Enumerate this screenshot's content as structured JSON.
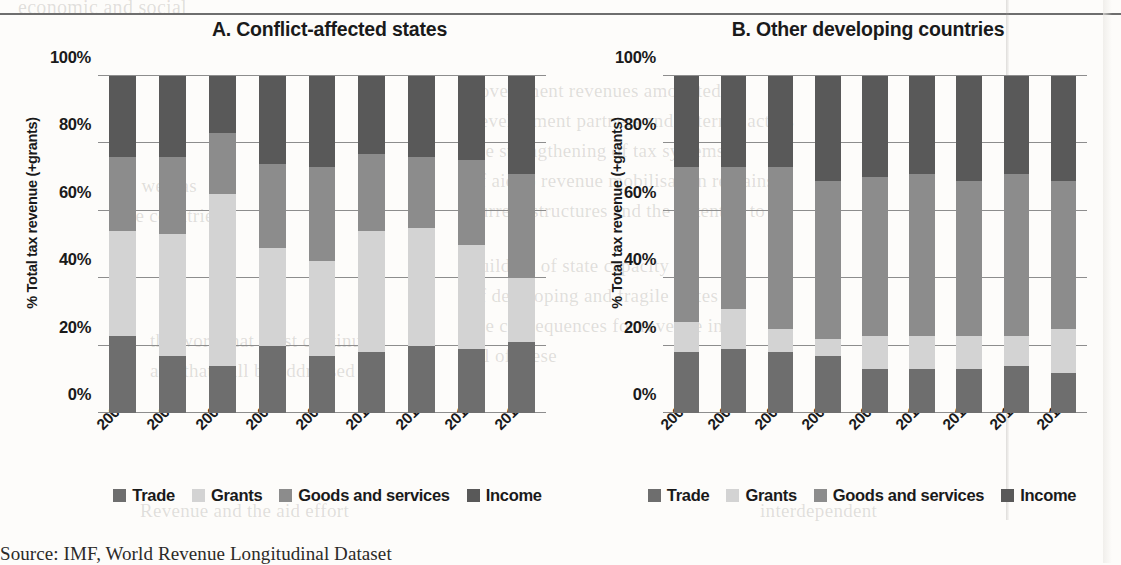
{
  "page": {
    "source_note": "Source: IMF, World Revenue Longitudinal Dataset"
  },
  "bleed_text": [
    {
      "t": "economic and social",
      "x": 18,
      "y": -4,
      "s": 20
    },
    {
      "t": "government revenues amounted to",
      "x": 470,
      "y": 80,
      "s": 19
    },
    {
      "t": "development partners and external actors",
      "x": 470,
      "y": 110,
      "s": 19
    },
    {
      "t": "the strengthening of tax systems is",
      "x": 470,
      "y": 140,
      "s": 19
    },
    {
      "t": "of aid to revenue mobilisation remains",
      "x": 470,
      "y": 170,
      "s": 19
    },
    {
      "t": "current structures and the potential to",
      "x": 470,
      "y": 200,
      "s": 19
    },
    {
      "t": "building of state capacity",
      "x": 470,
      "y": 255,
      "s": 19
    },
    {
      "t": "of developing and fragile states",
      "x": 470,
      "y": 285,
      "s": 19
    },
    {
      "t": "the consequences for revenue in",
      "x": 470,
      "y": 315,
      "s": 19
    },
    {
      "t": "all of these",
      "x": 470,
      "y": 345,
      "s": 19
    },
    {
      "t": "as well as",
      "x": 120,
      "y": 175,
      "s": 19
    },
    {
      "t": "the countries",
      "x": 120,
      "y": 205,
      "s": 19
    },
    {
      "t": "the work that must continue",
      "x": 150,
      "y": 330,
      "s": 19
    },
    {
      "t": "and that will be addressed",
      "x": 150,
      "y": 360,
      "s": 19
    },
    {
      "t": "Revenue and the aid effort",
      "x": 140,
      "y": 500,
      "s": 19
    },
    {
      "t": "interdependent",
      "x": 760,
      "y": 500,
      "s": 19
    }
  ],
  "chart_data": [
    {
      "id": "A",
      "type": "bar",
      "stacked": true,
      "normalized_percent": true,
      "title": "A. Conflict-affected states",
      "xlabel": "",
      "ylabel": "% Total tax revenue (+grants)",
      "ylim": [
        0,
        100
      ],
      "yticks": [
        "0%",
        "20%",
        "40%",
        "60%",
        "80%",
        "100%"
      ],
      "ytick_values": [
        0,
        20,
        40,
        60,
        80,
        100
      ],
      "grid": true,
      "legend_position": "bottom",
      "categories": [
        "2005",
        "2006",
        "2007",
        "2008",
        "2009",
        "2010",
        "2011",
        "2012",
        "2013"
      ],
      "series": [
        {
          "name": "Trade",
          "color": "#6e6e6e",
          "values": [
            23,
            17,
            14,
            20,
            17,
            18,
            20,
            19,
            21
          ]
        },
        {
          "name": "Grants",
          "color": "#d3d3d3",
          "values": [
            31,
            36,
            51,
            29,
            28,
            36,
            35,
            31,
            19
          ]
        },
        {
          "name": "Goods and services",
          "color": "#8c8c8c",
          "values": [
            22,
            23,
            18,
            25,
            28,
            23,
            21,
            25,
            31
          ]
        },
        {
          "name": "Income",
          "color": "#595959",
          "values": [
            24,
            24,
            17,
            26,
            27,
            23,
            24,
            25,
            29
          ]
        }
      ]
    },
    {
      "id": "B",
      "type": "bar",
      "stacked": true,
      "normalized_percent": true,
      "title": "B. Other developing countries",
      "xlabel": "",
      "ylabel": "% Total tax revenue (+grants)",
      "ylim": [
        0,
        100
      ],
      "yticks": [
        "0%",
        "20%",
        "40%",
        "60%",
        "80%",
        "100%"
      ],
      "ytick_values": [
        0,
        20,
        40,
        60,
        80,
        100
      ],
      "grid": true,
      "legend_position": "bottom",
      "categories": [
        "2005",
        "2006",
        "2007",
        "2008",
        "2009",
        "2010",
        "2011",
        "2012",
        "2013"
      ],
      "series": [
        {
          "name": "Trade",
          "color": "#6e6e6e",
          "values": [
            18,
            19,
            18,
            17,
            13,
            13,
            13,
            14,
            12
          ]
        },
        {
          "name": "Grants",
          "color": "#d3d3d3",
          "values": [
            9,
            12,
            7,
            5,
            10,
            10,
            10,
            9,
            13
          ]
        },
        {
          "name": "Goods and services",
          "color": "#8c8c8c",
          "values": [
            46,
            42,
            48,
            47,
            47,
            48,
            46,
            48,
            44
          ]
        },
        {
          "name": "Income",
          "color": "#595959",
          "values": [
            27,
            27,
            27,
            31,
            30,
            29,
            31,
            29,
            31
          ]
        }
      ]
    }
  ]
}
